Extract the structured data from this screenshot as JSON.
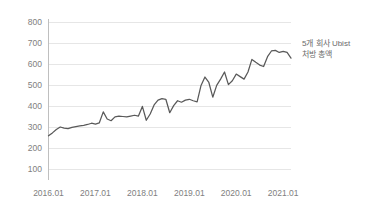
{
  "chart_data": {
    "type": "line",
    "title": "",
    "subtitle": "",
    "xlabel": "",
    "ylabel": "",
    "ylim": [
      0,
      800
    ],
    "ytick_labels": [
      "800",
      "700",
      "600",
      "500",
      "400",
      "300",
      "200",
      "100"
    ],
    "ytick_values": [
      800,
      700,
      600,
      500,
      400,
      300,
      200,
      100
    ],
    "xtick_labels": [
      "2016.01",
      "2017.01",
      "2018.01",
      "2019.01",
      "2020.01",
      "2021.01"
    ],
    "xtick_values": [
      "2016.01",
      "2017.01",
      "2018.01",
      "2019.01",
      "2020.01",
      "2021.01"
    ],
    "grid": "horizontal",
    "legend_position": "right",
    "legend_entries": [
      "5개 회사 Ubist 처방 총액"
    ],
    "series": [
      {
        "name": "5개 회사 Ubist 처방 총액",
        "color": "#595959",
        "x": [
          "2016.01",
          "2016.02",
          "2016.03",
          "2016.04",
          "2016.05",
          "2016.06",
          "2016.07",
          "2016.08",
          "2016.09",
          "2016.10",
          "2016.11",
          "2016.12",
          "2017.01",
          "2017.02",
          "2017.03",
          "2017.04",
          "2017.05",
          "2017.06",
          "2017.07",
          "2017.08",
          "2017.09",
          "2017.10",
          "2017.11",
          "2017.12",
          "2018.01",
          "2018.02",
          "2018.03",
          "2018.04",
          "2018.05",
          "2018.06",
          "2018.07",
          "2018.08",
          "2018.09",
          "2018.10",
          "2018.11",
          "2018.12",
          "2019.01",
          "2019.02",
          "2019.03",
          "2019.04",
          "2019.05",
          "2019.06",
          "2019.07",
          "2019.08",
          "2019.09",
          "2019.10",
          "2019.11",
          "2019.12",
          "2020.01",
          "2020.02",
          "2020.03",
          "2020.04",
          "2020.05",
          "2020.06",
          "2020.07",
          "2020.08",
          "2020.09",
          "2020.10",
          "2020.11",
          "2020.12",
          "2021.01",
          "2021.02",
          "2021.03"
        ],
        "values": [
          258,
          272,
          288,
          300,
          295,
          292,
          298,
          302,
          305,
          308,
          312,
          318,
          314,
          320,
          372,
          338,
          330,
          348,
          352,
          350,
          348,
          352,
          356,
          352,
          398,
          332,
          362,
          405,
          428,
          435,
          432,
          368,
          402,
          425,
          418,
          428,
          432,
          425,
          420,
          498,
          538,
          512,
          442,
          498,
          528,
          562,
          502,
          520,
          552,
          540,
          528,
          562,
          622,
          608,
          595,
          588,
          635,
          662,
          665,
          655,
          660,
          655,
          628
        ]
      }
    ]
  },
  "legend": {
    "line1": "5개 회사 Ubist",
    "line2": "처방 총액"
  }
}
